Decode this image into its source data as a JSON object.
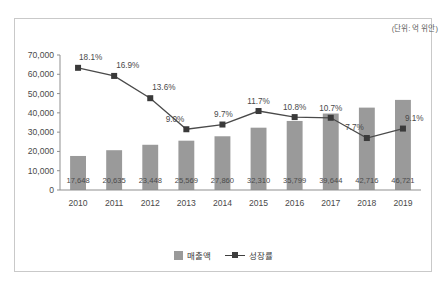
{
  "chart_data": {
    "type": "bar",
    "title": "",
    "subtitle": "",
    "unit_note": "(단위: 억 위안)",
    "xlabel": "",
    "ylabel": "",
    "categories": [
      "2010",
      "2011",
      "2012",
      "2013",
      "2014",
      "2015",
      "2016",
      "2017",
      "2018",
      "2019"
    ],
    "ylim": [
      0,
      70000
    ],
    "y_ticks": [
      "0",
      "10,000",
      "20,000",
      "30,000",
      "40,000",
      "50,000",
      "60,000",
      "70,000"
    ],
    "y_tick_values": [
      0,
      10000,
      20000,
      30000,
      40000,
      50000,
      60000,
      70000
    ],
    "grid": false,
    "legend_position": "bottom-center",
    "series": [
      {
        "name": "매출액",
        "type": "bar",
        "color": "#9a9a9a",
        "axis": "left",
        "values": [
          17648,
          20635,
          23448,
          25569,
          27860,
          32310,
          35799,
          39644,
          42716,
          46721
        ],
        "labels": [
          "17,648",
          "20,635",
          "23,448",
          "25,569",
          "27,860",
          "32,310",
          "35,799",
          "39,644",
          "42,716",
          "46,721"
        ]
      },
      {
        "name": "성장률",
        "type": "line",
        "color": "#3a3a3a",
        "axis": "right_percent",
        "values": [
          18.1,
          16.9,
          13.6,
          9.0,
          9.7,
          11.7,
          10.8,
          10.7,
          7.7,
          9.1
        ],
        "labels": [
          "18.1%",
          "16.9%",
          "13.6%",
          "9.0%",
          "9.7%",
          "11.7%",
          "10.8%",
          "10.7%",
          "7.7%",
          "9.1%"
        ],
        "percent_scale_max": 20.0
      }
    ]
  },
  "legend": {
    "bar_label": "매출액",
    "line_label": "성장률"
  }
}
